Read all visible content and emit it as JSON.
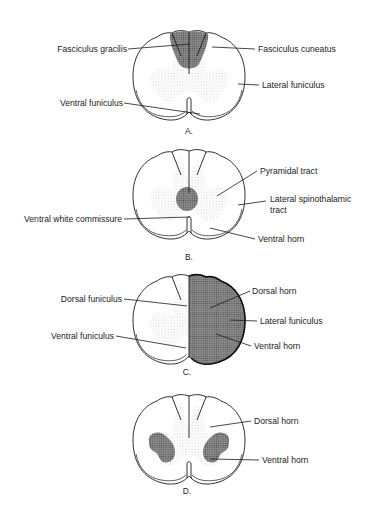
{
  "figure": {
    "panels": [
      {
        "id": "A",
        "label": "A.",
        "callouts": [
          {
            "text": "Fasciculus gracilis",
            "side": "left"
          },
          {
            "text": "Fasciculus cuneatus",
            "side": "right"
          },
          {
            "text": "Lateral funiculus",
            "side": "right"
          },
          {
            "text": "Ventral funiculus",
            "side": "left"
          }
        ],
        "highlight": "dorsal columns shaded"
      },
      {
        "id": "B",
        "label": "B.",
        "callouts": [
          {
            "text": "Pyramidal tract",
            "side": "right"
          },
          {
            "text": "Lateral spinothalamic",
            "side": "right"
          },
          {
            "text": "tract",
            "side": "right"
          },
          {
            "text": "Ventral white commissure",
            "side": "left"
          },
          {
            "text": "Ventral horn",
            "side": "right"
          }
        ],
        "highlight": "central region shaded"
      },
      {
        "id": "C",
        "label": "C.",
        "callouts": [
          {
            "text": "Dorsal funiculus",
            "side": "left"
          },
          {
            "text": "Dorsal horn",
            "side": "right"
          },
          {
            "text": "Lateral funiculus",
            "side": "right"
          },
          {
            "text": "Ventral funiculus",
            "side": "left"
          },
          {
            "text": "Ventral horn",
            "side": "right"
          }
        ],
        "highlight": "right half shaded"
      },
      {
        "id": "D",
        "label": "D.",
        "callouts": [
          {
            "text": "Dorsal horn",
            "side": "right"
          },
          {
            "text": "Ventral horn",
            "side": "right"
          }
        ],
        "highlight": "both ventral horns shaded"
      }
    ]
  }
}
